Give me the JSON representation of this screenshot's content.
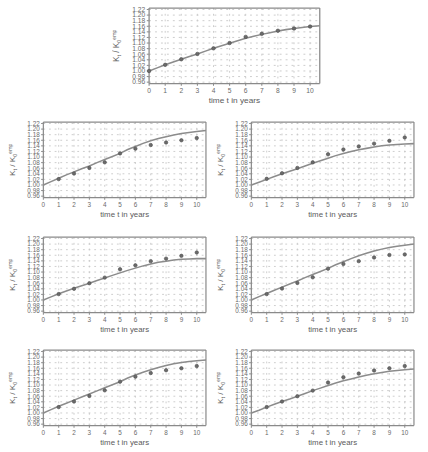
{
  "figure": {
    "panel_count": 7,
    "background": "#ffffff",
    "line_color": "#8c8c8c",
    "marker_color": "#6b6b6b",
    "grid_color": "#c9c9c9",
    "axis_color": "#8a8a8a"
  },
  "axes": {
    "xlabel": "time t in years",
    "ylabel_main": "K",
    "ylabel_sub": "t",
    "ylabel_div": " / K",
    "ylabel_sub2": "0",
    "ylabel_sup": "emp",
    "xticks": [
      "0",
      "1",
      "2",
      "3",
      "4",
      "5",
      "6",
      "7",
      "8",
      "9",
      "10"
    ],
    "yticks": [
      "1.22",
      "1.20",
      "1.18",
      "1.16",
      "1.14",
      "1.12",
      "1.10",
      "1.08",
      "1.06",
      "1.04",
      "1.02",
      "1.00",
      "0.98",
      "0.96"
    ],
    "xlim": [
      0,
      10.6
    ],
    "ylim": [
      0.955,
      1.225
    ],
    "grid": true,
    "legend": "none"
  },
  "chart_data": [
    {
      "type": "line",
      "id": "panel-0-top-center",
      "title": "",
      "xlabel": "time t in years",
      "ylabel": "K_t / K_0^emp",
      "xlim": [
        0,
        10.6
      ],
      "ylim": [
        0.96,
        1.22
      ],
      "grid": true,
      "series": [
        {
          "name": "model",
          "x": [
            0,
            0.5,
            1,
            1.5,
            2,
            2.5,
            3,
            3.5,
            4,
            4.5,
            5,
            5.5,
            6,
            6.5,
            7,
            7.5,
            8,
            8.5,
            9,
            9.5,
            10,
            10.6
          ],
          "values": [
            1.0,
            1.011,
            1.022,
            1.032,
            1.042,
            1.052,
            1.061,
            1.071,
            1.081,
            1.09,
            1.099,
            1.108,
            1.117,
            1.124,
            1.131,
            1.137,
            1.143,
            1.148,
            1.152,
            1.156,
            1.159,
            1.162
          ]
        },
        {
          "name": "empirical",
          "marker": "circle",
          "x": [
            0,
            1,
            2,
            3,
            4,
            5,
            6,
            7,
            8,
            9,
            10
          ],
          "values": [
            1.0,
            1.022,
            1.042,
            1.061,
            1.081,
            1.1,
            1.122,
            1.133,
            1.144,
            1.152,
            1.159
          ]
        }
      ]
    },
    {
      "type": "line",
      "id": "panel-1-row2-left",
      "title": "",
      "xlabel": "time t in years",
      "ylabel": "K_t / K_0^emp",
      "xlim": [
        0,
        10.6
      ],
      "ylim": [
        0.96,
        1.22
      ],
      "grid": true,
      "series": [
        {
          "name": "model",
          "x": [
            0,
            0.5,
            1,
            1.5,
            2,
            2.5,
            3,
            3.5,
            4,
            4.5,
            5,
            5.5,
            6,
            6.5,
            7,
            7.5,
            8,
            8.5,
            9,
            9.5,
            10,
            10.6
          ],
          "values": [
            1.0,
            1.012,
            1.024,
            1.036,
            1.047,
            1.058,
            1.068,
            1.08,
            1.091,
            1.102,
            1.113,
            1.127,
            1.138,
            1.149,
            1.158,
            1.166,
            1.173,
            1.179,
            1.184,
            1.188,
            1.191,
            1.195
          ]
        },
        {
          "name": "empirical",
          "marker": "circle",
          "x": [
            1,
            2,
            3,
            4,
            5,
            6,
            7,
            8,
            9,
            10
          ],
          "values": [
            1.021,
            1.041,
            1.061,
            1.081,
            1.113,
            1.13,
            1.143,
            1.152,
            1.16,
            1.168
          ]
        }
      ]
    },
    {
      "type": "line",
      "id": "panel-2-row2-right",
      "title": "",
      "xlabel": "time t in years",
      "ylabel": "K_t / K_0^emp",
      "xlim": [
        0,
        10.6
      ],
      "ylim": [
        0.96,
        1.22
      ],
      "grid": true,
      "series": [
        {
          "name": "model",
          "x": [
            0,
            0.5,
            1,
            1.5,
            2,
            2.5,
            3,
            3.5,
            4,
            4.5,
            5,
            5.5,
            6,
            6.5,
            7,
            7.5,
            8,
            8.5,
            9,
            9.5,
            10,
            10.6
          ],
          "values": [
            1.0,
            1.01,
            1.02,
            1.03,
            1.04,
            1.049,
            1.058,
            1.068,
            1.078,
            1.087,
            1.096,
            1.105,
            1.113,
            1.12,
            1.126,
            1.131,
            1.136,
            1.14,
            1.143,
            1.145,
            1.147,
            1.148
          ]
        },
        {
          "name": "empirical",
          "marker": "circle",
          "x": [
            1,
            2,
            3,
            4,
            5,
            6,
            7,
            8,
            9,
            10
          ],
          "values": [
            1.022,
            1.042,
            1.061,
            1.081,
            1.11,
            1.127,
            1.138,
            1.148,
            1.158,
            1.17
          ]
        }
      ]
    },
    {
      "type": "line",
      "id": "panel-3-row3-left",
      "title": "",
      "xlabel": "time t in years",
      "ylabel": "K_t / K_0^emp",
      "xlim": [
        0,
        10.6
      ],
      "ylim": [
        0.96,
        1.22
      ],
      "grid": true,
      "series": [
        {
          "name": "model",
          "x": [
            0,
            0.5,
            1,
            1.5,
            2,
            2.5,
            3,
            3.5,
            4,
            4.5,
            5,
            5.5,
            6,
            6.5,
            7,
            7.5,
            8,
            8.5,
            9,
            9.5,
            10,
            10.6
          ],
          "values": [
            1.0,
            1.011,
            1.022,
            1.032,
            1.042,
            1.051,
            1.06,
            1.07,
            1.079,
            1.088,
            1.097,
            1.106,
            1.114,
            1.122,
            1.129,
            1.135,
            1.139,
            1.143,
            1.146,
            1.147,
            1.148,
            1.148
          ]
        },
        {
          "name": "empirical",
          "marker": "circle",
          "x": [
            1,
            2,
            3,
            4,
            5,
            6,
            7,
            8,
            9,
            10
          ],
          "values": [
            1.021,
            1.04,
            1.06,
            1.08,
            1.11,
            1.124,
            1.139,
            1.148,
            1.158,
            1.17
          ]
        }
      ]
    },
    {
      "type": "line",
      "id": "panel-4-row3-right",
      "title": "",
      "xlabel": "time t in years",
      "ylabel": "K_t / K_0^emp",
      "xlim": [
        0,
        10.6
      ],
      "ylim": [
        0.96,
        1.22
      ],
      "grid": true,
      "series": [
        {
          "name": "model",
          "x": [
            0,
            0.5,
            1,
            1.5,
            2,
            2.5,
            3,
            3.5,
            4,
            4.5,
            5,
            5.5,
            6,
            6.5,
            7,
            7.5,
            8,
            8.5,
            9,
            9.5,
            10,
            10.6
          ],
          "values": [
            1.0,
            1.012,
            1.023,
            1.035,
            1.046,
            1.057,
            1.068,
            1.08,
            1.091,
            1.102,
            1.113,
            1.126,
            1.137,
            1.148,
            1.158,
            1.167,
            1.175,
            1.182,
            1.188,
            1.192,
            1.196,
            1.2
          ]
        },
        {
          "name": "empirical",
          "marker": "circle",
          "x": [
            1,
            2,
            3,
            4,
            5,
            6,
            7,
            8,
            9,
            10
          ],
          "values": [
            1.021,
            1.041,
            1.061,
            1.081,
            1.112,
            1.129,
            1.139,
            1.152,
            1.161,
            1.163
          ]
        }
      ]
    },
    {
      "type": "line",
      "id": "panel-5-row4-left",
      "title": "",
      "xlabel": "time t in years",
      "ylabel": "K_t / K_0^emp",
      "xlim": [
        0,
        10.6
      ],
      "ylim": [
        0.96,
        1.22
      ],
      "grid": true,
      "series": [
        {
          "name": "model",
          "x": [
            0,
            0.5,
            1,
            1.5,
            2,
            2.5,
            3,
            3.5,
            4,
            4.5,
            5,
            5.5,
            6,
            6.5,
            7,
            7.5,
            8,
            8.5,
            9,
            9.5,
            10,
            10.6
          ],
          "values": [
            1.0,
            1.012,
            1.024,
            1.035,
            1.046,
            1.057,
            1.068,
            1.079,
            1.09,
            1.101,
            1.112,
            1.125,
            1.136,
            1.146,
            1.155,
            1.163,
            1.17,
            1.176,
            1.181,
            1.184,
            1.187,
            1.19
          ]
        },
        {
          "name": "empirical",
          "marker": "circle",
          "x": [
            1,
            2,
            3,
            4,
            5,
            6,
            7,
            8,
            9,
            10
          ],
          "values": [
            1.021,
            1.041,
            1.061,
            1.081,
            1.112,
            1.13,
            1.143,
            1.153,
            1.16,
            1.168
          ]
        }
      ]
    },
    {
      "type": "line",
      "id": "panel-6-row4-right",
      "title": "",
      "xlabel": "time t in years",
      "ylabel": "K_t / K_0^emp",
      "xlim": [
        0,
        10.6
      ],
      "ylim": [
        0.96,
        1.22
      ],
      "grid": true,
      "series": [
        {
          "name": "model",
          "x": [
            0,
            0.5,
            1,
            1.5,
            2,
            2.5,
            3,
            3.5,
            4,
            4.5,
            5,
            5.5,
            6,
            6.5,
            7,
            7.5,
            8,
            8.5,
            9,
            9.5,
            10,
            10.6
          ],
          "values": [
            1.0,
            1.01,
            1.021,
            1.031,
            1.041,
            1.05,
            1.06,
            1.07,
            1.08,
            1.089,
            1.098,
            1.107,
            1.115,
            1.122,
            1.129,
            1.135,
            1.14,
            1.145,
            1.149,
            1.152,
            1.155,
            1.157
          ]
        },
        {
          "name": "empirical",
          "marker": "circle",
          "x": [
            1,
            2,
            3,
            4,
            5,
            6,
            7,
            8,
            9,
            10
          ],
          "values": [
            1.021,
            1.041,
            1.06,
            1.08,
            1.109,
            1.128,
            1.141,
            1.152,
            1.16,
            1.168
          ]
        }
      ]
    }
  ],
  "panel_geometry": [
    {
      "left": 112,
      "top": 2,
      "width": 212,
      "height": 106
    },
    {
      "left": 8,
      "top": 116,
      "width": 202,
      "height": 106
    },
    {
      "left": 216,
      "top": 116,
      "width": 202,
      "height": 106
    },
    {
      "left": 8,
      "top": 231,
      "width": 202,
      "height": 106
    },
    {
      "left": 216,
      "top": 231,
      "width": 202,
      "height": 106
    },
    {
      "left": 8,
      "top": 344,
      "width": 202,
      "height": 106
    },
    {
      "left": 216,
      "top": 344,
      "width": 202,
      "height": 106
    }
  ]
}
